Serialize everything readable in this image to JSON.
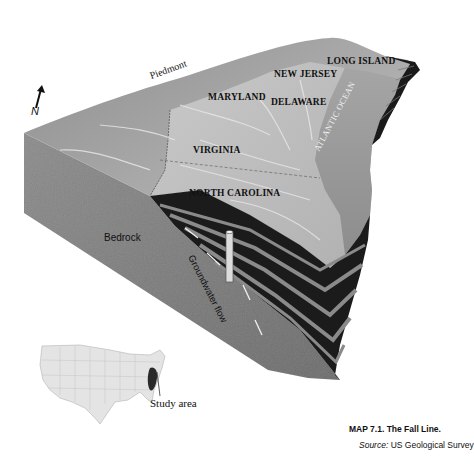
{
  "map": {
    "type": "3D block diagram (geologic cross-section)",
    "labels": {
      "piedmont": "Piedmont",
      "north": "N",
      "maryland": "MARYLAND",
      "new_jersey": "NEW JERSEY",
      "long_island": "LONG ISLAND",
      "delaware": "DELAWARE",
      "virginia": "VIRGINIA",
      "north_carolina": "NORTH CAROLINA",
      "atlantic_ocean": "ATLANTIC OCEAN",
      "bedrock": "Bedrock",
      "groundwater_flow": "Groundwater flow"
    },
    "inset": {
      "label": "Study area"
    },
    "colors": {
      "surface_light": "#bdbdbd",
      "surface_dark": "#8a8a8a",
      "bedrock": "#7a7a7a",
      "strata_dark": "#151515",
      "ocean": "#9a9a9a",
      "inset_fill": "#e6e6e6",
      "study_area": "#2a2a2a"
    }
  },
  "caption": {
    "title": "MAP 7.1. The Fall Line.",
    "source_prefix": "Source:",
    "source_text": " US Geological Survey"
  }
}
